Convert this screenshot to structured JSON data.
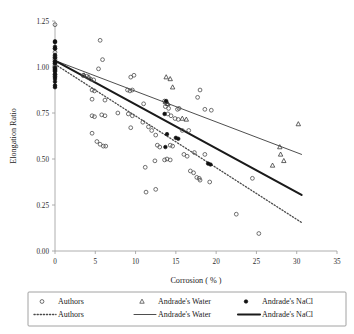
{
  "chart_data": {
    "type": "scatter",
    "title": "",
    "xlabel": "Corrosion ( % )",
    "ylabel": "Elongation Ratio",
    "xlim": [
      0,
      35
    ],
    "ylim": [
      0,
      1.25
    ],
    "xticks": [
      0,
      5,
      10,
      15,
      20,
      25,
      30,
      35
    ],
    "xtick_labels": [
      "0",
      "5",
      "10",
      "15",
      "20",
      "25",
      "30",
      "35"
    ],
    "yticks": [
      0,
      0.25,
      0.5,
      0.75,
      1.0,
      1.25
    ],
    "ytick_labels": [
      "0.00",
      "0.25",
      "0.50",
      "0.75",
      "1.00",
      "1.25"
    ],
    "grid": false,
    "legend_position": "below",
    "series": [
      {
        "name": "Authors",
        "marker": "open-circle",
        "color": "#4d4d4d",
        "points": [
          [
            0.0,
            1.23
          ],
          [
            0.0,
            1.1
          ],
          [
            0.0,
            1.08
          ],
          [
            0.0,
            1.06
          ],
          [
            0.0,
            1.05
          ],
          [
            0.0,
            1.04
          ],
          [
            0.0,
            1.03
          ],
          [
            0.0,
            1.02
          ],
          [
            0.0,
            1.01
          ],
          [
            0.0,
            1.0
          ],
          [
            0.0,
            0.99
          ],
          [
            0.0,
            0.98
          ],
          [
            0.0,
            0.96
          ],
          [
            0.0,
            0.95
          ],
          [
            5.6,
            1.145
          ],
          [
            5.9,
            1.04
          ],
          [
            5.4,
            0.99
          ],
          [
            3.5,
            0.955
          ],
          [
            3.9,
            0.95
          ],
          [
            4.4,
            0.935
          ],
          [
            4.8,
            0.93
          ],
          [
            4.6,
            0.875
          ],
          [
            4.9,
            0.87
          ],
          [
            6.2,
            0.82
          ],
          [
            4.6,
            0.825
          ],
          [
            9.0,
            0.875
          ],
          [
            9.3,
            0.87
          ],
          [
            9.6,
            0.875
          ],
          [
            9.4,
            0.945
          ],
          [
            9.8,
            0.955
          ],
          [
            11.0,
            0.8
          ],
          [
            13.6,
            0.815
          ],
          [
            13.9,
            0.8
          ],
          [
            13.7,
            0.785
          ],
          [
            14.1,
            0.775
          ],
          [
            15.4,
            0.775
          ],
          [
            15.2,
            0.77
          ],
          [
            14.0,
            0.745
          ],
          [
            14.4,
            0.735
          ],
          [
            14.9,
            0.72
          ],
          [
            15.3,
            0.715
          ],
          [
            17.7,
            0.835
          ],
          [
            18.0,
            0.875
          ],
          [
            18.6,
            0.77
          ],
          [
            19.4,
            0.765
          ],
          [
            4.6,
            0.735
          ],
          [
            4.9,
            0.73
          ],
          [
            5.8,
            0.74
          ],
          [
            6.2,
            0.735
          ],
          [
            7.8,
            0.75
          ],
          [
            9.1,
            0.745
          ],
          [
            9.6,
            0.735
          ],
          [
            9.4,
            0.67
          ],
          [
            10.9,
            0.7
          ],
          [
            11.6,
            0.675
          ],
          [
            12.0,
            0.655
          ],
          [
            12.5,
            0.63
          ],
          [
            4.6,
            0.64
          ],
          [
            5.2,
            0.595
          ],
          [
            5.6,
            0.58
          ],
          [
            6.0,
            0.57
          ],
          [
            6.3,
            0.57
          ],
          [
            12.7,
            0.575
          ],
          [
            13.0,
            0.565
          ],
          [
            14.3,
            0.575
          ],
          [
            14.6,
            0.57
          ],
          [
            13.6,
            0.495
          ],
          [
            13.9,
            0.5
          ],
          [
            14.3,
            0.495
          ],
          [
            12.4,
            0.49
          ],
          [
            11.2,
            0.455
          ],
          [
            15.8,
            0.655
          ],
          [
            16.6,
            0.655
          ],
          [
            16.0,
            0.525
          ],
          [
            16.4,
            0.515
          ],
          [
            17.3,
            0.535
          ],
          [
            18.6,
            0.525
          ],
          [
            16.8,
            0.435
          ],
          [
            17.2,
            0.425
          ],
          [
            17.6,
            0.4
          ],
          [
            17.9,
            0.395
          ],
          [
            18.0,
            0.385
          ],
          [
            19.2,
            0.375
          ],
          [
            11.3,
            0.32
          ],
          [
            12.5,
            0.335
          ],
          [
            24.5,
            0.395
          ],
          [
            22.5,
            0.2
          ],
          [
            25.3,
            0.095
          ]
        ]
      },
      {
        "name": "Andrade's Water",
        "marker": "open-triangle",
        "color": "#3a3a3a",
        "points": [
          [
            3.6,
            0.955
          ],
          [
            4.2,
            0.945
          ],
          [
            13.8,
            0.945
          ],
          [
            14.3,
            0.935
          ],
          [
            14.6,
            0.89
          ],
          [
            13.7,
            0.81
          ],
          [
            14.0,
            0.8
          ],
          [
            15.8,
            0.72
          ],
          [
            16.3,
            0.715
          ],
          [
            30.2,
            0.69
          ],
          [
            27.9,
            0.565
          ],
          [
            28.0,
            0.525
          ],
          [
            27.0,
            0.465
          ],
          [
            28.4,
            0.49
          ]
        ]
      },
      {
        "name": "Andrade's NaCl",
        "marker": "filled-circle",
        "color": "#111111",
        "points": [
          [
            0.0,
            1.14
          ],
          [
            0.0,
            1.135
          ],
          [
            0.0,
            1.11
          ],
          [
            0.0,
            1.1
          ],
          [
            0.0,
            1.065
          ],
          [
            0.0,
            1.05
          ],
          [
            0.0,
            1.03
          ],
          [
            0.0,
            1.02
          ],
          [
            0.0,
            0.995
          ],
          [
            0.0,
            0.985
          ],
          [
            0.0,
            0.975
          ],
          [
            0.0,
            0.96
          ],
          [
            0.0,
            0.945
          ],
          [
            0.0,
            0.935
          ],
          [
            0.0,
            0.92
          ],
          [
            0.0,
            0.9
          ],
          [
            0.0,
            0.89
          ],
          [
            13.8,
            0.815
          ],
          [
            13.6,
            0.745
          ],
          [
            13.9,
            0.635
          ],
          [
            15.0,
            0.615
          ],
          [
            15.3,
            0.61
          ],
          [
            13.7,
            0.565
          ],
          [
            19.0,
            0.475
          ],
          [
            19.3,
            0.47
          ]
        ]
      }
    ],
    "trendlines": [
      {
        "name": "Authors",
        "style": "dotted",
        "color": "#4a4a4a",
        "width": 1.3,
        "x0": 0.0,
        "y0": 1.015,
        "x1": 30.6,
        "y1": 0.155
      },
      {
        "name": "Andrade's Water",
        "style": "solid-thin",
        "color": "#3a3a3a",
        "width": 0.9,
        "x0": 0.0,
        "y0": 1.035,
        "x1": 30.6,
        "y1": 0.525
      },
      {
        "name": "Andrade's NaCl",
        "style": "solid-thick",
        "color": "#1a1a1a",
        "width": 2.1,
        "x0": 0.0,
        "y0": 1.035,
        "x1": 30.6,
        "y1": 0.305
      }
    ]
  },
  "legend": {
    "markers_row": [
      {
        "label": "Authors",
        "marker": "open-circle"
      },
      {
        "label": "Andrade's Water",
        "marker": "open-triangle"
      },
      {
        "label": "Andrade's NaCl",
        "marker": "filled-circle"
      }
    ],
    "lines_row": [
      {
        "label": "Authors",
        "style": "dotted"
      },
      {
        "label": "Andrade's Water",
        "style": "solid-thin"
      },
      {
        "label": "Andrade's NaCl",
        "style": "solid-thick"
      }
    ]
  }
}
